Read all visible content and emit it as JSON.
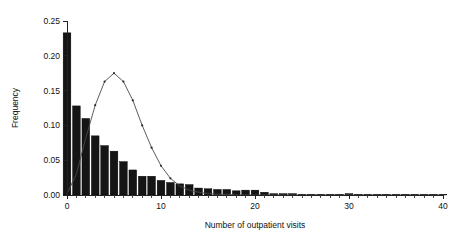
{
  "chart_data": {
    "type": "bar",
    "title": "",
    "subtitle": "",
    "xlabel": "Number of outpatient visits",
    "ylabel": "Frequency",
    "xlim": [
      -0.6,
      40
    ],
    "ylim": [
      0.0,
      0.25
    ],
    "grid": false,
    "legend": null,
    "x_ticks": [
      0,
      10,
      20,
      30,
      40
    ],
    "x_tick_labels": [
      "0",
      "10",
      "20",
      "30",
      "40"
    ],
    "x_minor_tick_step": 1,
    "y_ticks": [
      0.0,
      0.05,
      0.1,
      0.15,
      0.2,
      0.25
    ],
    "y_tick_labels": [
      "0.00",
      "0.05",
      "0.10",
      "0.15",
      "0.20",
      "0.25"
    ],
    "categories": [
      0,
      1,
      2,
      3,
      4,
      5,
      6,
      7,
      8,
      9,
      10,
      11,
      12,
      13,
      14,
      15,
      16,
      17,
      18,
      19,
      20,
      21,
      22,
      23,
      24,
      25,
      26,
      27,
      28,
      29,
      30,
      31,
      32,
      33,
      34,
      35,
      36,
      37,
      38,
      39,
      40
    ],
    "series": [
      {
        "name": "Observed frequency",
        "type": "bar",
        "values": [
          0.233,
          0.128,
          0.11,
          0.085,
          0.071,
          0.063,
          0.048,
          0.036,
          0.027,
          0.027,
          0.021,
          0.018,
          0.016,
          0.015,
          0.01,
          0.009,
          0.008,
          0.008,
          0.006,
          0.007,
          0.007,
          0.004,
          0.002,
          0.002,
          0.002,
          0.001,
          0.001,
          0.001,
          0.001,
          0.001,
          0.002,
          0.001,
          0.001,
          0.001,
          0.001,
          0.001,
          0.001,
          0.001,
          0.001,
          0.001,
          0.001
        ]
      },
      {
        "name": "Fitted distribution",
        "type": "line",
        "values": [
          0.002,
          0.03,
          0.082,
          0.129,
          0.163,
          0.175,
          0.163,
          0.136,
          0.1,
          0.068,
          0.042,
          0.024,
          0.013,
          0.007,
          0.004,
          0.002,
          0.001,
          0.001,
          0.0,
          0.0,
          0.0,
          0.0,
          0.0,
          0.0,
          0.0,
          0.0,
          0.0,
          0.0,
          0.0,
          0.0,
          0.0,
          0.0,
          0.0,
          0.0,
          0.0,
          0.0,
          0.0,
          0.0,
          0.0,
          0.0,
          0.0
        ]
      }
    ]
  }
}
